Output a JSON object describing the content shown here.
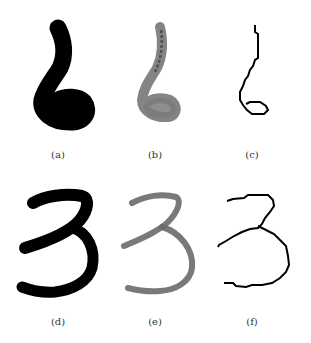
{
  "figure": {
    "panels": [
      {
        "id": "a",
        "label": "(a)",
        "digit": "6",
        "style": "binary-thick"
      },
      {
        "id": "b",
        "label": "(b)",
        "digit": "6",
        "style": "grayscale"
      },
      {
        "id": "c",
        "label": "(c)",
        "digit": "6",
        "style": "skeleton"
      },
      {
        "id": "d",
        "label": "(d)",
        "digit": "3",
        "style": "binary-thick"
      },
      {
        "id": "e",
        "label": "(e)",
        "digit": "3",
        "style": "grayscale"
      },
      {
        "id": "f",
        "label": "(f)",
        "digit": "3",
        "style": "skeleton"
      }
    ],
    "colors": {
      "binary": "#000000",
      "grayscale": "#6e6e6e",
      "skeleton": "#000000",
      "background": "#ffffff"
    }
  }
}
